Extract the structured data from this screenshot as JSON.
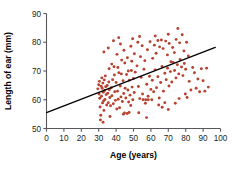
{
  "chart_data": {
    "type": "scatter",
    "title": "",
    "xlabel": "Age (years)",
    "ylabel": "Length of ear (mm)",
    "xlim": [
      0,
      100
    ],
    "ylim": [
      50,
      90
    ],
    "xticks": [
      0,
      10,
      20,
      30,
      40,
      50,
      60,
      70,
      80,
      90,
      100
    ],
    "yticks": [
      50,
      60,
      70,
      80,
      90
    ],
    "grid": false,
    "legend": null,
    "point_color": "#b5432f",
    "trendline_color": "#000000",
    "axis_color": "#58585a",
    "trendline": {
      "type": "linear",
      "x": [
        0,
        97
      ],
      "y": [
        55.5,
        78.2
      ],
      "slope": 0.234,
      "intercept": 55.5
    },
    "series": [
      {
        "name": "ear length vs age",
        "points": [
          [
            29.5,
            63.8
          ],
          [
            30.0,
            65.2
          ],
          [
            30.2,
            62.0
          ],
          [
            30.4,
            66.4
          ],
          [
            30.6,
            60.5
          ],
          [
            30.8,
            57.5
          ],
          [
            31.0,
            53.0
          ],
          [
            31.2,
            54.6
          ],
          [
            31.4,
            64.7
          ],
          [
            31.6,
            61.2
          ],
          [
            31.8,
            67.6
          ],
          [
            32.0,
            64.0
          ],
          [
            32.2,
            58.9
          ],
          [
            32.4,
            65.8
          ],
          [
            32.6,
            62.6
          ],
          [
            32.8,
            59.6
          ],
          [
            33.0,
            56.3
          ],
          [
            33.2,
            66.9
          ],
          [
            33.4,
            63.2
          ],
          [
            33.6,
            60.1
          ],
          [
            33.8,
            68.3
          ],
          [
            34.0,
            64.5
          ],
          [
            34.3,
            61.8
          ],
          [
            34.6,
            58.2
          ],
          [
            34.9,
            65.0
          ],
          [
            35.2,
            62.3
          ],
          [
            35.5,
            59.0
          ],
          [
            35.8,
            66.2
          ],
          [
            36.1,
            63.5
          ],
          [
            36.4,
            60.8
          ],
          [
            36.8,
            57.9
          ],
          [
            37.2,
            64.2
          ],
          [
            37.6,
            61.4
          ],
          [
            38.0,
            67.0
          ],
          [
            38.4,
            58.6
          ],
          [
            38.8,
            71.5
          ],
          [
            39.2,
            62.8
          ],
          [
            39.6,
            59.8
          ],
          [
            40.0,
            66.0
          ],
          [
            40.4,
            56.8
          ],
          [
            40.8,
            63.0
          ],
          [
            41.2,
            60.2
          ],
          [
            41.6,
            69.4
          ],
          [
            42.0,
            57.2
          ],
          [
            42.4,
            64.8
          ],
          [
            42.8,
            61.0
          ],
          [
            43.2,
            73.8
          ],
          [
            43.6,
            59.4
          ],
          [
            44.0,
            66.6
          ],
          [
            44.4,
            62.2
          ],
          [
            44.8,
            55.4
          ],
          [
            45.2,
            64.0
          ],
          [
            45.6,
            60.6
          ],
          [
            46.0,
            68.8
          ],
          [
            46.4,
            55.2
          ],
          [
            46.8,
            63.4
          ],
          [
            47.2,
            59.2
          ],
          [
            47.6,
            66.8
          ],
          [
            48.0,
            61.6
          ],
          [
            48.4,
            58.0
          ],
          [
            48.8,
            70.2
          ],
          [
            49.2,
            64.4
          ],
          [
            49.6,
            60.0
          ],
          [
            50.0,
            67.4
          ],
          [
            50.4,
            62.5
          ],
          [
            33.0,
            76.6
          ],
          [
            35.5,
            78.0
          ],
          [
            38.5,
            80.5
          ],
          [
            40.5,
            75.8
          ],
          [
            42.5,
            79.4
          ],
          [
            44.5,
            77.2
          ],
          [
            46.5,
            74.6
          ],
          [
            48.5,
            78.6
          ],
          [
            50.5,
            76.0
          ],
          [
            52.5,
            80.0
          ],
          [
            36.0,
            70.8
          ],
          [
            37.5,
            72.4
          ],
          [
            39.0,
            68.6
          ],
          [
            41.0,
            71.2
          ],
          [
            43.0,
            69.0
          ],
          [
            45.0,
            72.8
          ],
          [
            47.0,
            70.0
          ],
          [
            49.0,
            73.4
          ],
          [
            51.0,
            69.6
          ],
          [
            52.0,
            71.8
          ],
          [
            52.8,
            64.6
          ],
          [
            53.6,
            60.4
          ],
          [
            54.4,
            67.8
          ],
          [
            55.2,
            62.0
          ],
          [
            56.0,
            70.6
          ],
          [
            56.8,
            58.8
          ],
          [
            57.6,
            65.4
          ],
          [
            58.4,
            61.2
          ],
          [
            59.2,
            68.2
          ],
          [
            60.0,
            63.6
          ],
          [
            53.0,
            55.5
          ],
          [
            55.5,
            60.0
          ],
          [
            57.0,
            60.0
          ],
          [
            58.5,
            60.0
          ],
          [
            60.5,
            60.0
          ],
          [
            54.0,
            75.0
          ],
          [
            55.0,
            78.8
          ],
          [
            56.5,
            73.6
          ],
          [
            58.0,
            77.4
          ],
          [
            59.5,
            80.2
          ],
          [
            61.0,
            74.4
          ],
          [
            62.0,
            79.0
          ],
          [
            63.0,
            76.2
          ],
          [
            64.0,
            80.6
          ],
          [
            65.0,
            78.4
          ],
          [
            60.8,
            66.8
          ],
          [
            61.6,
            62.8
          ],
          [
            62.4,
            70.4
          ],
          [
            63.2,
            64.2
          ],
          [
            64.0,
            68.0
          ],
          [
            64.8,
            60.6
          ],
          [
            65.6,
            66.0
          ],
          [
            66.4,
            71.6
          ],
          [
            67.2,
            63.0
          ],
          [
            68.0,
            69.2
          ],
          [
            66.0,
            80.8
          ],
          [
            67.0,
            77.8
          ],
          [
            68.5,
            80.4
          ],
          [
            69.5,
            75.6
          ],
          [
            70.5,
            79.6
          ],
          [
            71.5,
            73.2
          ],
          [
            72.5,
            78.2
          ],
          [
            73.5,
            76.4
          ],
          [
            74.5,
            81.0
          ],
          [
            75.5,
            84.8
          ],
          [
            68.8,
            67.0
          ],
          [
            69.6,
            71.0
          ],
          [
            70.4,
            64.8
          ],
          [
            71.2,
            69.8
          ],
          [
            72.0,
            66.2
          ],
          [
            72.8,
            73.0
          ],
          [
            73.6,
            70.2
          ],
          [
            74.4,
            67.6
          ],
          [
            75.2,
            72.2
          ],
          [
            76.0,
            69.0
          ],
          [
            76.8,
            74.0
          ],
          [
            77.6,
            71.4
          ],
          [
            78.4,
            68.4
          ],
          [
            79.2,
            72.6
          ],
          [
            80.0,
            70.6
          ],
          [
            76.5,
            79.8
          ],
          [
            78.0,
            82.6
          ],
          [
            79.0,
            77.0
          ],
          [
            80.5,
            80.0
          ],
          [
            81.5,
            75.2
          ],
          [
            64.5,
            58.2
          ],
          [
            66.5,
            57.4
          ],
          [
            68.0,
            59.0
          ],
          [
            70.0,
            56.6
          ],
          [
            74.0,
            58.8
          ],
          [
            76.2,
            60.4
          ],
          [
            79.8,
            62.0
          ],
          [
            80.8,
            60.8
          ],
          [
            82.0,
            66.4
          ],
          [
            83.0,
            63.4
          ],
          [
            84.0,
            71.2
          ],
          [
            85.0,
            69.4
          ],
          [
            86.0,
            64.0
          ],
          [
            87.0,
            67.2
          ],
          [
            88.0,
            62.8
          ],
          [
            89.0,
            70.8
          ],
          [
            90.0,
            66.6
          ],
          [
            91.0,
            63.0
          ],
          [
            92.0,
            71.0
          ],
          [
            93.0,
            64.4
          ],
          [
            57.5,
            53.8
          ],
          [
            47.5,
            55.6
          ],
          [
            44.2,
            55.0
          ],
          [
            36.5,
            54.2
          ],
          [
            32.5,
            52.2
          ],
          [
            53.5,
            82.0
          ],
          [
            49.5,
            81.2
          ],
          [
            41.5,
            81.6
          ],
          [
            62.5,
            82.2
          ],
          [
            70.0,
            82.8
          ]
        ]
      }
    ]
  }
}
